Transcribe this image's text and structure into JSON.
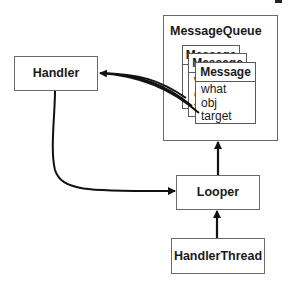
{
  "diagram": {
    "nodes": {
      "handler": {
        "label": "Handler"
      },
      "message_queue": {
        "label": "MessageQueue"
      },
      "looper": {
        "label": "Looper"
      },
      "handler_thread": {
        "label": "HandlerThread"
      },
      "messages": [
        {
          "label": "Message",
          "fields": [
            "what",
            "obj",
            "target"
          ]
        },
        {
          "label": "Message",
          "fields": [
            "what",
            "obj",
            "target"
          ]
        },
        {
          "label": "Message",
          "fields": [
            "what",
            "obj",
            "target"
          ]
        }
      ]
    },
    "edges": [
      {
        "from": "Message.target (x3)",
        "to": "Handler"
      },
      {
        "from": "Handler",
        "to": "Looper"
      },
      {
        "from": "Looper",
        "to": "MessageQueue"
      },
      {
        "from": "HandlerThread",
        "to": "Looper"
      }
    ]
  }
}
